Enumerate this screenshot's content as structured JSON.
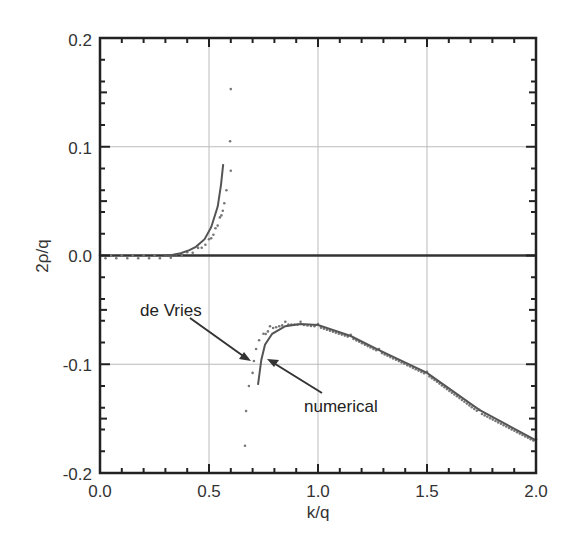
{
  "chart_data": {
    "type": "line",
    "title": "",
    "xlabel": "k/q",
    "ylabel": "2ρ/q",
    "xlim": [
      0.0,
      2.0
    ],
    "ylim": [
      -0.2,
      0.2
    ],
    "grid": true,
    "legend": null,
    "x_ticks": [
      "0.0",
      "0.5",
      "1.0",
      "1.5",
      "2.0"
    ],
    "y_ticks": [
      "-0.2",
      "-0.1",
      "0.0",
      "0.1",
      "0.2"
    ],
    "zero_line": 0.0,
    "series": [
      {
        "name": "numerical",
        "style": "solid",
        "segments": [
          [
            [
              0.29,
              0.0
            ],
            [
              0.33,
              0.0005
            ],
            [
              0.37,
              0.002
            ],
            [
              0.41,
              0.005
            ],
            [
              0.44,
              0.008
            ],
            [
              0.48,
              0.015
            ],
            [
              0.51,
              0.026
            ],
            [
              0.54,
              0.045
            ],
            [
              0.555,
              0.065
            ],
            [
              0.565,
              0.084
            ]
          ],
          [
            [
              0.725,
              -0.119
            ],
            [
              0.74,
              -0.096
            ],
            [
              0.757,
              -0.082
            ],
            [
              0.79,
              -0.072
            ],
            [
              0.85,
              -0.065
            ],
            [
              0.92,
              -0.063
            ],
            [
              1.0,
              -0.064
            ],
            [
              1.15,
              -0.074
            ],
            [
              1.28,
              -0.087
            ],
            [
              1.5,
              -0.108
            ],
            [
              1.74,
              -0.142
            ],
            [
              2.0,
              -0.17
            ]
          ]
        ]
      },
      {
        "name": "de Vries",
        "style": "dotted",
        "points": [
          [
            0.0,
            0.0
          ],
          [
            0.05,
            0.0
          ],
          [
            0.1,
            0.0
          ],
          [
            0.15,
            0.0
          ],
          [
            0.2,
            0.0
          ],
          [
            0.25,
            0.0
          ],
          [
            0.3,
            0.0
          ],
          [
            0.35,
            0.001
          ],
          [
            0.4,
            0.003
          ],
          [
            0.45,
            0.007
          ],
          [
            0.5,
            0.015
          ],
          [
            0.53,
            0.025
          ],
          [
            0.55,
            0.035
          ],
          [
            0.57,
            0.048
          ],
          [
            0.58,
            0.06
          ],
          [
            0.6,
            0.078
          ],
          [
            0.597,
            0.105
          ],
          [
            0.6,
            0.153
          ],
          [
            0.665,
            -0.175
          ],
          [
            0.67,
            -0.143
          ],
          [
            0.683,
            -0.12
          ],
          [
            0.7,
            -0.108
          ],
          [
            0.706,
            -0.097
          ],
          [
            0.716,
            -0.086
          ],
          [
            0.73,
            -0.078
          ],
          [
            0.75,
            -0.072
          ],
          [
            0.78,
            -0.065
          ],
          [
            0.85,
            -0.061
          ],
          [
            0.92,
            -0.061
          ],
          [
            1.0,
            -0.063
          ],
          [
            1.15,
            -0.073
          ],
          [
            1.28,
            -0.086
          ],
          [
            1.5,
            -0.107
          ],
          [
            1.74,
            -0.142
          ],
          [
            2.0,
            -0.169
          ]
        ]
      }
    ],
    "annotations": [
      {
        "text": "de Vries",
        "text_at": [
          0.19,
          -0.045
        ],
        "arrow_to": [
          0.69,
          -0.097
        ]
      },
      {
        "text": "numerical",
        "text_at": [
          0.94,
          -0.133
        ],
        "arrow_to": [
          0.77,
          -0.095
        ]
      }
    ]
  },
  "labels": {
    "xlabel": "k/q",
    "ylabel": "2ρ/q",
    "annot_devries": "de Vries",
    "annot_numerical": "numerical",
    "xt0": "0.0",
    "xt1": "0.5",
    "xt2": "1.0",
    "xt3": "1.5",
    "xt4": "2.0",
    "yt0": "-0.2",
    "yt1": "-0.1",
    "yt2": "0.0",
    "yt3": "0.1",
    "yt4": "0.2"
  },
  "colors": {
    "frame": "#222222",
    "grid": "#bbbbbb",
    "line": "#555555",
    "dots": "#777777",
    "zero_line": "#333333"
  }
}
